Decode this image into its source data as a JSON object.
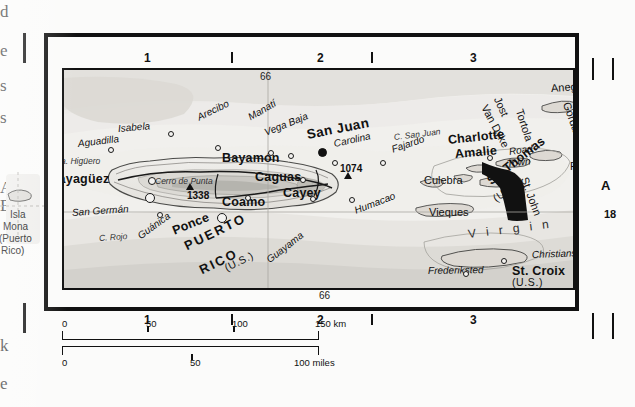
{
  "page": {
    "sheet_background": "#fbfbfa",
    "map_background": "#f4f3f1",
    "ink": "#111111"
  },
  "gutter_bleed": {
    "note": "clipped letters of facing-page text column",
    "chars": [
      {
        "text": "d",
        "top": 2
      },
      {
        "text": "e",
        "top": 41
      },
      {
        "text": "s",
        "top": 76
      },
      {
        "text": "s",
        "top": 108
      },
      {
        "text": "A",
        "top": 178
      },
      {
        "text": "B",
        "top": 196
      },
      {
        "text": "k",
        "top": 336
      },
      {
        "text": "e",
        "top": 374
      }
    ]
  },
  "inset_left": {
    "label_line1": "Isla",
    "label_line2": "Mona",
    "label_line3": "(Puerto",
    "label_line4": "Rico)"
  },
  "grid": {
    "top_numbers": [
      "1",
      "2",
      "3"
    ],
    "bottom_numbers": [
      "1",
      "2",
      "3"
    ],
    "right_letters": [
      "A"
    ],
    "right_number": "18"
  },
  "graticule": {
    "meridian_top": "66",
    "meridian_bottom": "66"
  },
  "scale": {
    "km": {
      "ticks": [
        "0",
        "50",
        "100",
        "150"
      ],
      "unit": "km"
    },
    "miles": {
      "ticks": [
        "0",
        "50",
        "100"
      ],
      "unit": "miles"
    }
  },
  "labels": {
    "capitals": [
      {
        "name": "San Juan",
        "x": 307,
        "y": 128,
        "rot": -11
      }
    ],
    "cities": [
      {
        "name": "Mayagüez",
        "x": 48,
        "y": 173,
        "rot": 0
      },
      {
        "name": "Bayamón",
        "x": 222,
        "y": 152,
        "rot": 0
      },
      {
        "name": "Caguas",
        "x": 255,
        "y": 171,
        "rot": 0
      },
      {
        "name": "Cayey",
        "x": 283,
        "y": 187,
        "rot": 0
      },
      {
        "name": "Coamo",
        "x": 222,
        "y": 196,
        "rot": 0
      },
      {
        "name": "Ponce",
        "x": 173,
        "y": 225,
        "rot": -22
      },
      {
        "name": "St. Croix",
        "x": 512,
        "y": 265,
        "rot": 0
      },
      {
        "name": "St. Thomas",
        "x": 489,
        "y": 176,
        "rot": -38
      },
      {
        "name": "Charlotte",
        "x": 448,
        "y": 134,
        "rot": -6
      },
      {
        "name": "Amalie",
        "x": 455,
        "y": 148,
        "rot": -5
      }
    ],
    "towns": [
      {
        "name": "Isabela",
        "x": 118,
        "y": 124,
        "rot": -5
      },
      {
        "name": "Aguadilla",
        "x": 78,
        "y": 139,
        "rot": -7
      },
      {
        "name": "Arecibo",
        "x": 198,
        "y": 113,
        "rot": -26
      },
      {
        "name": "Manatí",
        "x": 249,
        "y": 113,
        "rot": -30
      },
      {
        "name": "Vega Baja",
        "x": 265,
        "y": 128,
        "rot": -22
      },
      {
        "name": "Carolina",
        "x": 334,
        "y": 139,
        "rot": -12
      },
      {
        "name": "Fajardo",
        "x": 392,
        "y": 145,
        "rot": -19
      },
      {
        "name": "Humacao",
        "x": 355,
        "y": 206,
        "rot": -21
      },
      {
        "name": "Guayama",
        "x": 268,
        "y": 256,
        "rot": -38
      },
      {
        "name": "San Germán",
        "x": 72,
        "y": 208,
        "rot": -4
      },
      {
        "name": "Guánica",
        "x": 139,
        "y": 232,
        "rot": -36
      },
      {
        "name": "Road",
        "x": 509,
        "y": 147,
        "rot": -8
      },
      {
        "name": "Town",
        "x": 507,
        "y": 159,
        "rot": -6
      },
      {
        "name": "Christiansted",
        "x": 532,
        "y": 250,
        "rot": -2
      },
      {
        "name": "Frederiksted",
        "x": 428,
        "y": 266,
        "rot": -1
      }
    ],
    "capes": [
      {
        "name": "Pta. Higüero",
        "x": 53,
        "y": 157,
        "rot": 0
      },
      {
        "name": "C. Rojo",
        "x": 99,
        "y": 234,
        "rot": -4
      },
      {
        "name": "C. San Juan",
        "x": 394,
        "y": 133,
        "rot": -7
      }
    ],
    "peaks": [
      {
        "name": "Cerro de Punta",
        "elev": "1338",
        "x": 155,
        "y": 177,
        "rot": 0
      },
      {
        "name": "",
        "elev": "1074",
        "x": 340,
        "y": 164,
        "rot": 0
      }
    ],
    "islands": [
      {
        "name": "Culebra",
        "x": 424,
        "y": 175,
        "rot": 0
      },
      {
        "name": "Vieques",
        "x": 429,
        "y": 207,
        "rot": 0
      },
      {
        "name": "Anegada",
        "x": 551,
        "y": 83,
        "rot": -4
      },
      {
        "name": "Virgin",
        "x": 578,
        "y": 91,
        "rot": 70
      },
      {
        "name": "Gorda",
        "x": 566,
        "y": 97,
        "rot": 70
      },
      {
        "name": "Tortola",
        "x": 519,
        "y": 104,
        "rot": 72
      },
      {
        "name": "Jost",
        "x": 497,
        "y": 92,
        "rot": 66
      },
      {
        "name": "Van Dyke",
        "x": 484,
        "y": 100,
        "rot": 62
      },
      {
        "name": "St. John",
        "x": 524,
        "y": 172,
        "rot": 70
      },
      {
        "name": "Peter I.",
        "x": 570,
        "y": 161,
        "rot": 0
      }
    ],
    "sovereignty": [
      {
        "name": "(U.K.)",
        "x": 577,
        "y": 146,
        "rot": 0
      },
      {
        "name": "(U.S.)",
        "x": 494,
        "y": 194,
        "rot": -34
      },
      {
        "name": "(U.S.)",
        "x": 512,
        "y": 277,
        "rot": 0
      },
      {
        "name": "(U.S.)",
        "x": 510,
        "y": 185,
        "rot": 62
      },
      {
        "name": "(U.S.)",
        "x": 225,
        "y": 263,
        "rot": -26
      }
    ],
    "regions": [
      {
        "name": "PUERTO",
        "x": 185,
        "y": 240,
        "rot": -26
      },
      {
        "name": "RICO",
        "x": 200,
        "y": 264,
        "rot": -26
      }
    ],
    "water": [
      {
        "name": "V i r g i n",
        "x": 468,
        "y": 228,
        "rot": -7
      },
      {
        "name": "I s .",
        "x": 577,
        "y": 205,
        "rot": -6
      }
    ]
  }
}
